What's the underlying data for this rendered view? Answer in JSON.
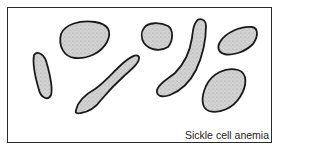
{
  "figure": {
    "caption": "Sickle cell anemia",
    "colors": {
      "outline": "#1a1a1a",
      "fill": "#cfcfcf",
      "stipple": "#8a8a8a",
      "frame": "#2a2a2a"
    },
    "cells": [
      {
        "id": "elongated-left",
        "shape": "elongated"
      },
      {
        "id": "oval-top-left",
        "shape": "oval"
      },
      {
        "id": "sickle-diagonal",
        "shape": "sickle"
      },
      {
        "id": "oval-top-center",
        "shape": "oval"
      },
      {
        "id": "sickle-curved",
        "shape": "sickle"
      },
      {
        "id": "oval-top-right",
        "shape": "oval"
      },
      {
        "id": "teardrop-bottom-right",
        "shape": "teardrop"
      }
    ]
  }
}
